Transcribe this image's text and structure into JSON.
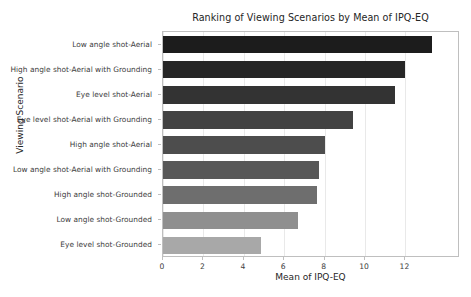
{
  "chart_data": {
    "type": "bar",
    "orientation": "horizontal",
    "title": "Ranking of Viewing Scenarios by Mean of IPQ-EQ",
    "xlabel": "Mean of IPQ-EQ",
    "ylabel": "Viewing Scenario",
    "categories": [
      "Low angle shot-Aerial",
      "High angle shot-Aerial with Grounding",
      "Eye level shot-Aerial",
      "Eye level shot-Aerial with Grounding",
      "High angle shot-Aerial",
      "Low angle shot-Aerial with Grounding",
      "High angle shot-Grounded",
      "Low angle shot-Grounded",
      "Eye level shot-Grounded"
    ],
    "values": [
      13.3,
      12.0,
      11.5,
      9.4,
      8.0,
      7.7,
      7.6,
      6.7,
      4.85
    ],
    "bar_colors": [
      "#1c1c1c",
      "#262626",
      "#333333",
      "#424242",
      "#4d4d4d",
      "#585858",
      "#6e6e6e",
      "#8f8f8f",
      "#a8a8a8"
    ],
    "xlim": [
      0,
      14.7
    ],
    "xticks": [
      0,
      2,
      4,
      6,
      8,
      10,
      12
    ],
    "xtick_labels": [
      "0",
      "2",
      "4",
      "6",
      "8",
      "10",
      "12"
    ],
    "grid": true,
    "grid_axis": "x",
    "legend": null,
    "axis_color": "#bfbfbf",
    "text_color": "#262626"
  }
}
